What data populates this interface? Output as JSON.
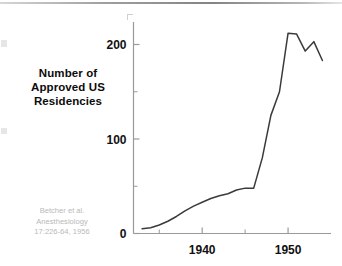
{
  "axis_title": {
    "lines": [
      "Number of",
      "Approved US",
      "Residencies"
    ]
  },
  "citation": {
    "lines": [
      "Betcher et al.",
      "Anesthesiology",
      "17:226-64, 1956"
    ]
  },
  "colors": {
    "line": "#3a3a3a",
    "axis": "#9a9a9a",
    "text": "#111111",
    "citation": "#b9b9b9",
    "background": "#ffffff"
  },
  "chart_data": {
    "type": "line",
    "title": "",
    "xlabel": "",
    "ylabel": "Number of Approved US Residencies",
    "xlim": [
      1932,
      1955
    ],
    "ylim": [
      0,
      235
    ],
    "grid": false,
    "legend": "none",
    "y_ticks_major": [
      0,
      100,
      200
    ],
    "y_tick_labels": [
      "0",
      "100",
      "200"
    ],
    "y_ticks_minor": [
      50,
      150
    ],
    "x_ticks_major": [
      1940,
      1950
    ],
    "x_tick_labels": [
      "1940",
      "1950"
    ],
    "x_ticks_minor": [
      1935,
      1945
    ],
    "x": [
      1933,
      1934,
      1935,
      1936,
      1937,
      1938,
      1939,
      1940,
      1941,
      1942,
      1943,
      1944,
      1945,
      1946,
      1947,
      1948,
      1949,
      1950,
      1951,
      1952,
      1953,
      1954
    ],
    "values": [
      5,
      6,
      9,
      13,
      18,
      24,
      29,
      33,
      37,
      40,
      42,
      46,
      48,
      48,
      80,
      125,
      150,
      212,
      211,
      193,
      203,
      183
    ],
    "series": [
      {
        "name": "Approved US Residencies",
        "values": [
          5,
          6,
          9,
          13,
          18,
          24,
          29,
          33,
          37,
          40,
          42,
          46,
          48,
          48,
          80,
          125,
          150,
          212,
          211,
          193,
          203,
          183
        ]
      }
    ]
  }
}
